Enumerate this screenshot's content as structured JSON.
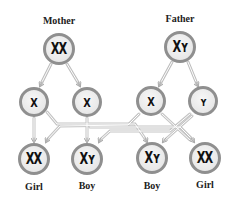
{
  "parents": {
    "mother": {
      "label": "Mother",
      "chromosomes": "XX"
    },
    "father": {
      "label": "Father",
      "chromosomes": "XY"
    }
  },
  "gametes": [
    {
      "from": "mother",
      "chromosome": "X"
    },
    {
      "from": "mother",
      "chromosome": "X"
    },
    {
      "from": "father",
      "chromosome": "X"
    },
    {
      "from": "father",
      "chromosome": "Y"
    }
  ],
  "offspring": [
    {
      "label": "Girl",
      "chromosomes": "XX"
    },
    {
      "label": "Boy",
      "chromosomes": "XY"
    },
    {
      "label": "Boy",
      "chromosomes": "XY"
    },
    {
      "label": "Girl",
      "chromosomes": "XX"
    }
  ],
  "glyphs": {
    "XX": "XX",
    "XY": "Xʏ",
    "X": "X",
    "Y": "ʏ"
  },
  "colors": {
    "ring": "#8f8f8f",
    "fill": "#ececec",
    "line": "#c4c4c4",
    "text": "#222222"
  }
}
